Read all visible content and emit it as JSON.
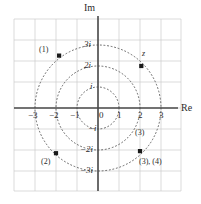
{
  "figure": {
    "kind": "complex-plane-argand-diagram",
    "axes": {
      "real_axis_label": "Re",
      "imag_axis_label": "Im",
      "origin_label": "0"
    },
    "real_ticks": [
      {
        "value": -3,
        "text": "−3"
      },
      {
        "value": -2,
        "text": "−2"
      },
      {
        "value": -1,
        "text": "−1"
      },
      {
        "value": 1,
        "text": "1"
      },
      {
        "value": 2,
        "text": "2"
      },
      {
        "value": 3,
        "text": "3"
      }
    ],
    "imag_ticks": [
      {
        "value": 3,
        "text": "3i"
      },
      {
        "value": 2,
        "text": "2i"
      },
      {
        "value": 1,
        "text": "i"
      },
      {
        "value": -1,
        "text": "−i"
      },
      {
        "value": -2,
        "text": "−2i"
      },
      {
        "value": -3,
        "text": "−3i"
      }
    ],
    "circles": [
      {
        "radius": 1,
        "style": "dotted"
      },
      {
        "radius": 2,
        "style": "dotted"
      },
      {
        "radius": 3,
        "style": "dotted"
      }
    ],
    "points": [
      {
        "id": "p1",
        "label": "(1)",
        "re": -1.75,
        "im": 2.25
      },
      {
        "id": "pz",
        "label": "z",
        "re": 2.15,
        "im": 2.0
      },
      {
        "id": "p2",
        "label": "(2)",
        "re": -2.0,
        "im": -2.2
      },
      {
        "id": "p34",
        "label": "(3), (4)",
        "re": 2.0,
        "im": -2.15
      }
    ],
    "annotations": [
      {
        "id": "a3",
        "text": "(3)"
      }
    ],
    "colors": {
      "axis": "#4a4a4a",
      "grid": "#cccccc",
      "circle": "#555555",
      "point": "#1a1a1a",
      "text": "#2b2b2b",
      "background": "#ffffff"
    }
  }
}
